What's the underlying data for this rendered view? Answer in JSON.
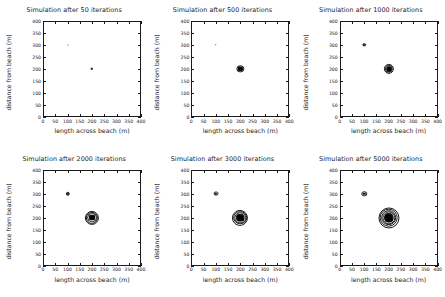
{
  "figure": {
    "layout": "2x3 grid of simulation snapshots",
    "rows": 2,
    "cols": 3
  },
  "axes": {
    "xlabel": "length across beach (m)",
    "ylabel": "distance from beach (m)",
    "xticks": [
      "0",
      "50",
      "100",
      "150",
      "200",
      "250",
      "300",
      "350",
      "400"
    ],
    "yticks": [
      "0",
      "50",
      "100",
      "150",
      "200",
      "250",
      "300",
      "350",
      "400"
    ],
    "xlim": [
      0,
      400
    ],
    "ylim": [
      0,
      400
    ],
    "grid": "off",
    "tick_direction": "in",
    "box": "on"
  },
  "chart_data": [
    {
      "type": "scatter",
      "title": "Simulation after 50 iterations",
      "iterations": 50,
      "xlabel": "length across beach (m)",
      "ylabel": "distance from beach (m)",
      "xlim": [
        0,
        400
      ],
      "ylim": [
        0,
        400
      ],
      "plumes": [
        {
          "name": "secondary-source",
          "x": 100,
          "y": 300,
          "core_radius_m": 2,
          "rings_m": []
        },
        {
          "name": "primary-source",
          "x": 200,
          "y": 200,
          "core_radius_m": 5,
          "rings_m": []
        }
      ]
    },
    {
      "type": "scatter",
      "title": "Simulation after 500 iterations",
      "iterations": 500,
      "xlabel": "length across beach (m)",
      "ylabel": "distance from beach (m)",
      "xlim": [
        0,
        400
      ],
      "ylim": [
        0,
        400
      ],
      "plumes": [
        {
          "name": "secondary-source",
          "x": 100,
          "y": 300,
          "core_radius_m": 3,
          "rings_m": []
        },
        {
          "name": "primary-source",
          "x": 200,
          "y": 200,
          "core_radius_m": 11,
          "rings_m": [
            15
          ]
        }
      ]
    },
    {
      "type": "scatter",
      "title": "Simulation after 1000 iterations",
      "iterations": 1000,
      "xlabel": "length across beach (m)",
      "ylabel": "distance from beach (m)",
      "xlim": [
        0,
        400
      ],
      "ylim": [
        0,
        400
      ],
      "plumes": [
        {
          "name": "secondary-source",
          "x": 100,
          "y": 300,
          "core_radius_m": 4,
          "rings_m": [
            7
          ]
        },
        {
          "name": "primary-source",
          "x": 200,
          "y": 200,
          "core_radius_m": 12,
          "rings_m": [
            17,
            21
          ]
        }
      ]
    },
    {
      "type": "scatter",
      "title": "Simulation after 2000 iterations",
      "iterations": 2000,
      "xlabel": "length across beach (m)",
      "ylabel": "distance from beach (m)",
      "xlim": [
        0,
        400
      ],
      "ylim": [
        0,
        400
      ],
      "plumes": [
        {
          "name": "secondary-source",
          "x": 100,
          "y": 300,
          "core_radius_m": 5,
          "rings_m": [
            9
          ]
        },
        {
          "name": "primary-source",
          "x": 200,
          "y": 200,
          "core_radius_m": 14,
          "rings_m": [
            20,
            25,
            29
          ]
        }
      ]
    },
    {
      "type": "scatter",
      "title": "Simulation after 3000 iterations",
      "iterations": 3000,
      "xlabel": "length across beach (m)",
      "ylabel": "distance from beach (m)",
      "xlim": [
        0,
        400
      ],
      "ylim": [
        0,
        400
      ],
      "plumes": [
        {
          "name": "secondary-source",
          "x": 100,
          "y": 300,
          "core_radius_m": 5,
          "rings_m": [
            10
          ]
        },
        {
          "name": "primary-source",
          "x": 200,
          "y": 200,
          "core_radius_m": 17,
          "rings_m": [
            23,
            28,
            33
          ]
        }
      ]
    },
    {
      "type": "scatter",
      "title": "Simulation after 5000 iterations",
      "iterations": 5000,
      "xlabel": "length across beach (m)",
      "ylabel": "distance from beach (m)",
      "xlim": [
        0,
        400
      ],
      "ylim": [
        0,
        400
      ],
      "plumes": [
        {
          "name": "secondary-source",
          "x": 100,
          "y": 300,
          "core_radius_m": 5,
          "rings_m": [
            11
          ]
        },
        {
          "name": "primary-source",
          "x": 200,
          "y": 200,
          "core_radius_m": 21,
          "rings_m": [
            27,
            32,
            38,
            43
          ]
        }
      ]
    }
  ]
}
